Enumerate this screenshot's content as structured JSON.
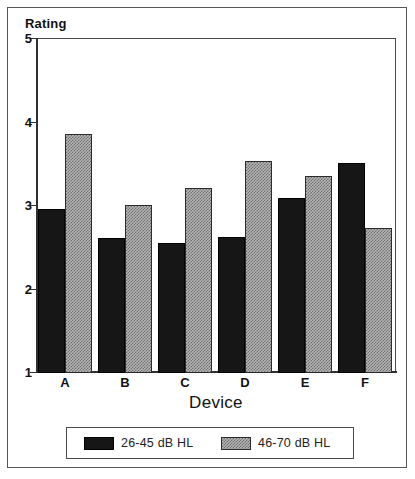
{
  "chart_data": {
    "type": "bar",
    "title": "",
    "ylabel": "Rating",
    "xlabel": "Device",
    "categories": [
      "A",
      "B",
      "C",
      "D",
      "E",
      "F"
    ],
    "series": [
      {
        "name": "26-45 dB HL",
        "pattern": "solid-black",
        "color": "#161616",
        "values": [
          2.95,
          2.6,
          2.55,
          2.62,
          3.08,
          3.5
        ]
      },
      {
        "name": "46-70 dB HL",
        "pattern": "dotted-gray",
        "color": "#b6b6b6",
        "values": [
          3.85,
          3.0,
          3.2,
          3.53,
          3.35,
          2.73
        ]
      }
    ],
    "ylim": [
      1,
      5
    ],
    "yticks": [
      1,
      2,
      3,
      4,
      5
    ],
    "ytick_labels": [
      "1",
      "2",
      "3",
      "4",
      "5"
    ],
    "grid": false,
    "legend_position": "below-axes",
    "baseline": 1
  },
  "axis": {
    "y_label": "Rating",
    "x_label": "Device",
    "y_tick_labels": [
      "5",
      "4",
      "3",
      "2",
      "1"
    ],
    "x_tick_labels": [
      "A",
      "B",
      "C",
      "D",
      "E",
      "F"
    ]
  },
  "legend": {
    "entries": [
      {
        "label": "26-45 dB HL",
        "swatch": "solid-black-swatch"
      },
      {
        "label": "46-70 dB HL",
        "swatch": "dotted-gray-swatch"
      }
    ]
  }
}
